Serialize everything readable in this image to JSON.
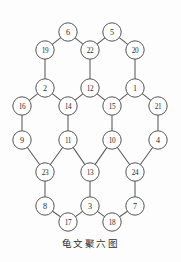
{
  "figure": {
    "caption": "龟文聚六图",
    "title": "龟文聚六图",
    "width": 181,
    "height": 262,
    "background_color": "#fdfdfd",
    "node_fill_color": "#ffffff",
    "node_stroke_color": "#555555",
    "edge_color": "#5a5a5a",
    "label_color": "#2b2b2b",
    "node_radius": 9.2,
    "node_count": 24,
    "edge_count": 33
  },
  "nodes": [
    {
      "id": "n6",
      "label": "6",
      "x": 68,
      "y": 32
    },
    {
      "id": "n5",
      "label": "5",
      "x": 112,
      "y": 32
    },
    {
      "id": "n19",
      "label": "19",
      "x": 45,
      "y": 50
    },
    {
      "id": "n22",
      "label": "22",
      "x": 90,
      "y": 50
    },
    {
      "id": "n20",
      "label": "20",
      "x": 135,
      "y": 50
    },
    {
      "id": "n2",
      "label": "2",
      "x": 45,
      "y": 88
    },
    {
      "id": "n12",
      "label": "12",
      "x": 90,
      "y": 88
    },
    {
      "id": "n1",
      "label": "1",
      "x": 135,
      "y": 88
    },
    {
      "id": "n16",
      "label": "16",
      "x": 22,
      "y": 106
    },
    {
      "id": "n14",
      "label": "14",
      "x": 68,
      "y": 106
    },
    {
      "id": "n15",
      "label": "15",
      "x": 112,
      "y": 106
    },
    {
      "id": "n21",
      "label": "21",
      "x": 158,
      "y": 106
    },
    {
      "id": "n9",
      "label": "9",
      "x": 22,
      "y": 140
    },
    {
      "id": "n11",
      "label": "11",
      "x": 68,
      "y": 140
    },
    {
      "id": "n10",
      "label": "10",
      "x": 112,
      "y": 140
    },
    {
      "id": "n4",
      "label": "4",
      "x": 158,
      "y": 140
    },
    {
      "id": "n23",
      "label": "23",
      "x": 45,
      "y": 172
    },
    {
      "id": "n13",
      "label": "13",
      "x": 90,
      "y": 172
    },
    {
      "id": "n24",
      "label": "24",
      "x": 135,
      "y": 172
    },
    {
      "id": "n8",
      "label": "8",
      "x": 45,
      "y": 206
    },
    {
      "id": "n3",
      "label": "3",
      "x": 90,
      "y": 206
    },
    {
      "id": "n7",
      "label": "7",
      "x": 135,
      "y": 206
    },
    {
      "id": "n17",
      "label": "17",
      "x": 68,
      "y": 222
    },
    {
      "id": "n18",
      "label": "18",
      "x": 112,
      "y": 222
    }
  ],
  "edges": [
    {
      "from": "n6",
      "to": "n19"
    },
    {
      "from": "n6",
      "to": "n22"
    },
    {
      "from": "n5",
      "to": "n22"
    },
    {
      "from": "n5",
      "to": "n20"
    },
    {
      "from": "n19",
      "to": "n2"
    },
    {
      "from": "n22",
      "to": "n12"
    },
    {
      "from": "n20",
      "to": "n1"
    },
    {
      "from": "n2",
      "to": "n16"
    },
    {
      "from": "n2",
      "to": "n14"
    },
    {
      "from": "n12",
      "to": "n14"
    },
    {
      "from": "n12",
      "to": "n15"
    },
    {
      "from": "n1",
      "to": "n15"
    },
    {
      "from": "n1",
      "to": "n21"
    },
    {
      "from": "n16",
      "to": "n9"
    },
    {
      "from": "n14",
      "to": "n11"
    },
    {
      "from": "n15",
      "to": "n10"
    },
    {
      "from": "n21",
      "to": "n4"
    },
    {
      "from": "n9",
      "to": "n23"
    },
    {
      "from": "n11",
      "to": "n23"
    },
    {
      "from": "n11",
      "to": "n13"
    },
    {
      "from": "n10",
      "to": "n13"
    },
    {
      "from": "n10",
      "to": "n24"
    },
    {
      "from": "n4",
      "to": "n24"
    },
    {
      "from": "n23",
      "to": "n8"
    },
    {
      "from": "n13",
      "to": "n3"
    },
    {
      "from": "n24",
      "to": "n7"
    },
    {
      "from": "n8",
      "to": "n17"
    },
    {
      "from": "n3",
      "to": "n17"
    },
    {
      "from": "n3",
      "to": "n18"
    },
    {
      "from": "n7",
      "to": "n18"
    }
  ]
}
